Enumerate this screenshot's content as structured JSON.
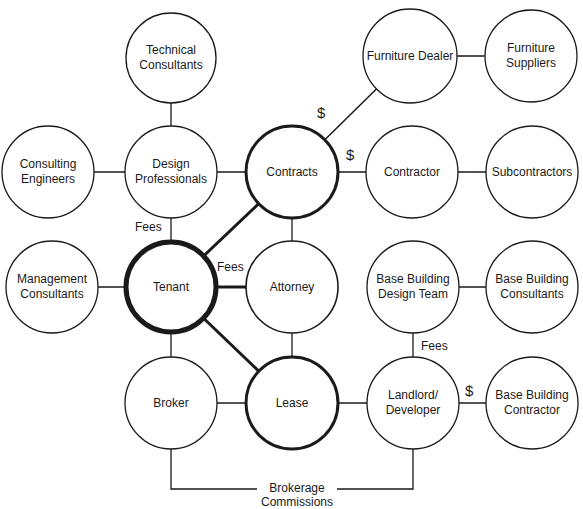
{
  "diagram": {
    "nodes": [
      {
        "id": "technical-consultants",
        "label": "Technical\nConsultants",
        "cx": 171,
        "cy": 58,
        "r": 45,
        "sw": 1.3
      },
      {
        "id": "consulting-engineers",
        "label": "Consulting\nEngineers",
        "cx": 48,
        "cy": 172,
        "r": 46,
        "sw": 1.3
      },
      {
        "id": "design-professionals",
        "label": "Design\nProfessionals",
        "cx": 171,
        "cy": 172,
        "r": 46,
        "sw": 1.3
      },
      {
        "id": "contracts",
        "label": "Contracts",
        "cx": 292,
        "cy": 172,
        "r": 46,
        "sw": 3
      },
      {
        "id": "furniture-dealer",
        "label": "Furniture Dealer",
        "cx": 410,
        "cy": 56,
        "r": 47,
        "sw": 1.3
      },
      {
        "id": "furniture-suppliers",
        "label": "Furniture\nSuppliers",
        "cx": 531,
        "cy": 56,
        "r": 46,
        "sw": 1.3
      },
      {
        "id": "contractor",
        "label": "Contractor",
        "cx": 412,
        "cy": 172,
        "r": 46,
        "sw": 1.3
      },
      {
        "id": "subcontractors",
        "label": "Subcontractors",
        "cx": 532,
        "cy": 172,
        "r": 46,
        "sw": 1.3
      },
      {
        "id": "management-consultants",
        "label": "Management\nConsultants",
        "cx": 52,
        "cy": 287,
        "r": 46,
        "sw": 1.3
      },
      {
        "id": "tenant",
        "label": "Tenant",
        "cx": 171,
        "cy": 287,
        "r": 45,
        "sw": 5
      },
      {
        "id": "attorney",
        "label": "Attorney",
        "cx": 292,
        "cy": 287,
        "r": 46,
        "sw": 1.6
      },
      {
        "id": "base-building-design-team",
        "label": "Base Building\nDesign Team",
        "cx": 413,
        "cy": 287,
        "r": 46,
        "sw": 1.3
      },
      {
        "id": "base-building-consultants",
        "label": "Base Building\nConsultants",
        "cx": 532,
        "cy": 287,
        "r": 46,
        "sw": 1.3
      },
      {
        "id": "broker",
        "label": "Broker",
        "cx": 171,
        "cy": 403,
        "r": 46,
        "sw": 1.3
      },
      {
        "id": "lease",
        "label": "Lease",
        "cx": 292,
        "cy": 403,
        "r": 46,
        "sw": 3
      },
      {
        "id": "landlord-developer",
        "label": "Landlord/\nDeveloper",
        "cx": 413,
        "cy": 403,
        "r": 46,
        "sw": 1.3
      },
      {
        "id": "base-building-contractor",
        "label": "Base Building\nContractor",
        "cx": 532,
        "cy": 403,
        "r": 46,
        "sw": 1.3
      }
    ],
    "edges": [
      {
        "from": "technical-consultants",
        "to": "design-professionals",
        "sw": 1.3
      },
      {
        "from": "consulting-engineers",
        "to": "design-professionals",
        "sw": 1.3
      },
      {
        "from": "design-professionals",
        "to": "contracts",
        "sw": 1.3
      },
      {
        "from": "design-professionals",
        "to": "tenant",
        "sw": 1.3
      },
      {
        "from": "contracts",
        "to": "furniture-dealer",
        "sw": 1.5
      },
      {
        "from": "contracts",
        "to": "contractor",
        "sw": 1.3
      },
      {
        "from": "furniture-dealer",
        "to": "furniture-suppliers",
        "sw": 1.3
      },
      {
        "from": "contractor",
        "to": "subcontractors",
        "sw": 1.3
      },
      {
        "from": "contracts",
        "to": "attorney",
        "sw": 1.3
      },
      {
        "from": "management-consultants",
        "to": "tenant",
        "sw": 1.3
      },
      {
        "from": "tenant",
        "to": "contracts",
        "sw": 3
      },
      {
        "from": "tenant",
        "to": "attorney",
        "sw": 3
      },
      {
        "from": "tenant",
        "to": "lease",
        "sw": 3
      },
      {
        "from": "tenant",
        "to": "broker",
        "sw": 1.3
      },
      {
        "from": "attorney",
        "to": "lease",
        "sw": 1.3
      },
      {
        "from": "broker",
        "to": "lease",
        "sw": 1.3
      },
      {
        "from": "lease",
        "to": "landlord-developer",
        "sw": 1.3
      },
      {
        "from": "base-building-design-team",
        "to": "base-building-consultants",
        "sw": 1.3
      },
      {
        "from": "base-building-design-team",
        "to": "landlord-developer",
        "sw": 1.3
      },
      {
        "from": "landlord-developer",
        "to": "base-building-contractor",
        "sw": 1.3
      }
    ],
    "brokerage_path": "M171,449 L171,489 L257,489 M337,489 L413,489 L413,449",
    "annotations": [
      {
        "id": "fees-design",
        "text": "Fees",
        "x": 135,
        "y": 220
      },
      {
        "id": "fees-attorney",
        "text": "Fees",
        "x": 217,
        "y": 260
      },
      {
        "id": "fees-landlord",
        "text": "Fees",
        "x": 421,
        "y": 339
      },
      {
        "id": "dollar-furniture",
        "text": "$",
        "x": 317,
        "y": 106,
        "dollar": true
      },
      {
        "id": "dollar-contractor",
        "text": "$",
        "x": 346,
        "y": 148,
        "dollar": true
      },
      {
        "id": "dollar-base-contractor",
        "text": "$",
        "x": 465,
        "y": 384,
        "dollar": true
      },
      {
        "id": "brokerage-commissions",
        "text": "Brokerage\nCommissions",
        "x": 257,
        "y": 481
      }
    ]
  }
}
